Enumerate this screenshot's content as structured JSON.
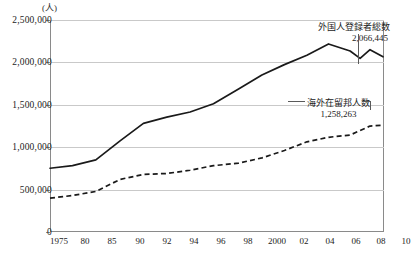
{
  "chart_data": {
    "type": "line",
    "title": "",
    "xlabel": "(年)",
    "ylabel": "(人)",
    "ylim": [
      0,
      2500000
    ],
    "xlim": [
      1975,
      2013
    ],
    "grid": true,
    "legend_position": "inline-annotation",
    "yticks": [
      "0",
      "500,000",
      "1,000,000",
      "1,500,000",
      "2,000,000",
      "2,500,000"
    ],
    "ytick_values": [
      0,
      500000,
      1000000,
      1500000,
      2000000,
      2500000
    ],
    "xticks": [
      "1975",
      "80",
      "85",
      "90",
      "92",
      "94",
      "96",
      "98",
      "2000",
      "02",
      "04",
      "06",
      "08",
      "10",
      "12",
      "13"
    ],
    "xtick_values": [
      1975,
      1980,
      1985,
      1990,
      1992,
      1994,
      1996,
      1998,
      2000,
      2002,
      2004,
      2006,
      2008,
      2010,
      2012,
      2013
    ],
    "series": [
      {
        "name": "外国人登録者総数",
        "style": "solid",
        "color": "#1a1a1a",
        "x": [
          1975,
          1980,
          1985,
          1990,
          1992,
          1994,
          1996,
          1998,
          2000,
          2002,
          2004,
          2006,
          2008,
          2010,
          2011,
          2012,
          2013
        ],
        "values": [
          751842,
          782910,
          850612,
          1075317,
          1281644,
          1354011,
          1415136,
          1512116,
          1686444,
          1851758,
          1973747,
          2084919,
          2217426,
          2134151,
          2047349,
          2150000,
          2066445
        ],
        "end_label": "2,066,445"
      },
      {
        "name": "海外在留邦人数",
        "style": "dashed",
        "color": "#1a1a1a",
        "x": [
          1975,
          1980,
          1985,
          1990,
          1992,
          1994,
          1996,
          1998,
          2000,
          2002,
          2004,
          2006,
          2008,
          2010,
          2012,
          2013
        ],
        "values": [
          399201,
          430000,
          478168,
          620174,
          679379,
          689895,
          728268,
          782568,
          811712,
          873641,
          961307,
          1063695,
          1116993,
          1143357,
          1249577,
          1258263
        ],
        "end_label": "1,258,263"
      }
    ],
    "annotations": [
      {
        "id": "foreign-registrants",
        "label": "外国人登録者総数",
        "value": "2,066,445"
      },
      {
        "id": "overseas-japanese",
        "label": "海外在留邦人数",
        "value": "1,258,263"
      }
    ]
  }
}
